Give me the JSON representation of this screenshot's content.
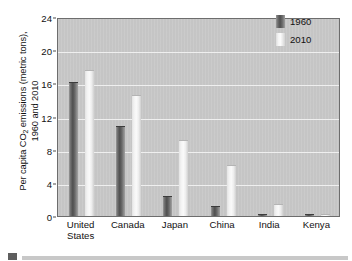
{
  "chart_data": {
    "type": "bar",
    "title": "",
    "xlabel": "",
    "ylabel_line1": "Per capita CO",
    "ylabel_sub": "2",
    "ylabel_line1_rest": " emissions (metric tons),",
    "ylabel_line2": "1960 and 2010",
    "categories": [
      "United States",
      "Canada",
      "Japan",
      "China",
      "India",
      "Kenya"
    ],
    "category_lines": [
      [
        "United",
        "States"
      ],
      [
        "Canada",
        ""
      ],
      [
        "Japan",
        ""
      ],
      [
        "China",
        ""
      ],
      [
        "India",
        ""
      ],
      [
        "Kenya",
        ""
      ]
    ],
    "series": [
      {
        "name": "1960",
        "color": "#5a5a5a",
        "values": [
          16.2,
          10.8,
          2.4,
          1.2,
          0.3,
          0.3
        ]
      },
      {
        "name": "2010",
        "color": "#f0f0f0",
        "values": [
          17.6,
          14.6,
          9.2,
          6.1,
          1.5,
          0.3
        ]
      }
    ],
    "ylim": [
      0,
      24
    ],
    "yticks": [
      0,
      4,
      8,
      12,
      16,
      20,
      24
    ],
    "ytick_labels": [
      "0",
      "4",
      "8",
      "12",
      "16",
      "20",
      "24"
    ],
    "grid": true,
    "grid_axis": "y",
    "legend_position": "top-right",
    "plot_background": "#c9c9c9",
    "grid_color": "#efefef",
    "axis_color": "#6d6d6d"
  },
  "legend": {
    "items": [
      {
        "label": "1960"
      },
      {
        "label": "2010"
      }
    ]
  }
}
